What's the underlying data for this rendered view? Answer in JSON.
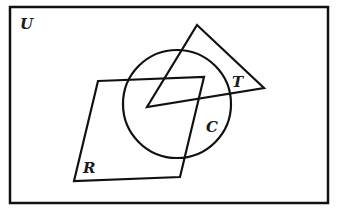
{
  "diagram": {
    "type": "venn",
    "stroke_color": "#111111",
    "background": "#ffffff",
    "universe": {
      "label": "U",
      "rect": [
        10,
        7,
        318,
        196
      ]
    },
    "sets": [
      {
        "name": "triangle",
        "label": "T",
        "shape": "triangle",
        "points": [
          [
            197,
            25
          ],
          [
            264,
            88
          ],
          [
            147,
            107
          ]
        ]
      },
      {
        "name": "circle",
        "label": "C",
        "shape": "circle",
        "center": [
          177,
          104
        ],
        "radius": 54
      },
      {
        "name": "parallelogram",
        "label": "R",
        "shape": "quadrilateral",
        "points": [
          [
            98,
            81
          ],
          [
            204,
            77
          ],
          [
            180,
            177
          ],
          [
            74,
            181
          ]
        ]
      }
    ]
  },
  "labels": {
    "universe": "U",
    "triangle": "T",
    "circle": "C",
    "rhombus": "R"
  }
}
